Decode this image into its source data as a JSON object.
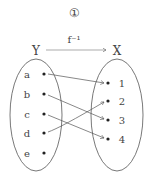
{
  "diagram": {
    "number_label": "①",
    "mapping_label": "f⁻¹",
    "domain_set": {
      "name": "Y",
      "elements": [
        "a",
        "b",
        "c",
        "d",
        "e"
      ]
    },
    "codomain_set": {
      "name": "X",
      "elements": [
        "1",
        "2",
        "3",
        "4"
      ]
    },
    "mappings": [
      {
        "from": "a",
        "to": "1"
      },
      {
        "from": "b",
        "to": "3"
      },
      {
        "from": "c",
        "to": "4"
      },
      {
        "from": "d",
        "to": "2"
      }
    ],
    "colors": {
      "line": "#555555",
      "text": "#444444"
    }
  }
}
